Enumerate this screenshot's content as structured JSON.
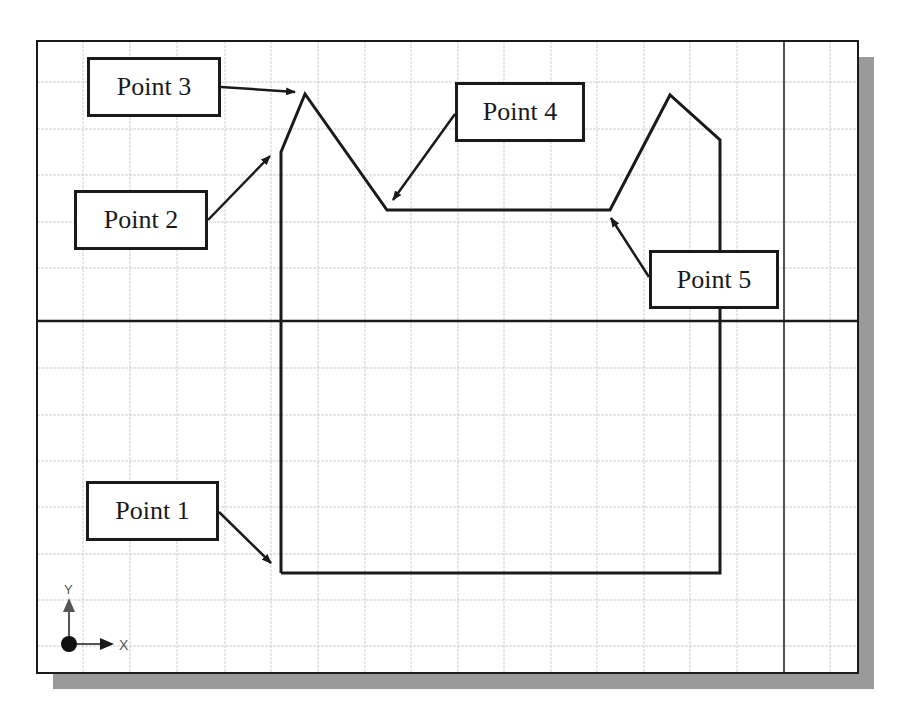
{
  "colors": {
    "background": "#ffffff",
    "grid": "#cfcfcf",
    "frame": "#1a1a1a",
    "shadow": "#9a9a9a",
    "profile": "#1a1a1a",
    "axis_icon": "#555555"
  },
  "canvas": {
    "frame": {
      "x": 37,
      "y": 41,
      "width": 821,
      "height": 632
    },
    "shadow_offset": 16,
    "grid": {
      "vertical": [
        83,
        130,
        177,
        225,
        271,
        318,
        365,
        411,
        458,
        504,
        551,
        597,
        644,
        690,
        737,
        830
      ],
      "horizontal": [
        82,
        129,
        175,
        222,
        268,
        368,
        415,
        461,
        507,
        554,
        600,
        646
      ]
    },
    "axes": {
      "x_axis_y": 321,
      "y_axis_x": 784
    }
  },
  "profile": {
    "points": [
      [
        281,
        573
      ],
      [
        281,
        152
      ],
      [
        305,
        94
      ],
      [
        387,
        210
      ],
      [
        610,
        210
      ],
      [
        670,
        95
      ],
      [
        720,
        140
      ],
      [
        720,
        573
      ],
      [
        281,
        573
      ]
    ]
  },
  "labels": [
    {
      "id": "point-1",
      "text": "Point 1",
      "box": {
        "x": 86,
        "y": 481,
        "w": 133,
        "h": 60
      },
      "arrow": {
        "x1": 219,
        "y1": 512,
        "x2": 271,
        "y2": 563
      }
    },
    {
      "id": "point-2",
      "text": "Point 2",
      "box": {
        "x": 74,
        "y": 190,
        "w": 134,
        "h": 60
      },
      "arrow": {
        "x1": 208,
        "y1": 220,
        "x2": 270,
        "y2": 156
      }
    },
    {
      "id": "point-3",
      "text": "Point 3",
      "box": {
        "x": 87,
        "y": 57,
        "w": 134,
        "h": 60
      },
      "arrow": {
        "x1": 221,
        "y1": 87,
        "x2": 295,
        "y2": 92
      }
    },
    {
      "id": "point-4",
      "text": "Point 4",
      "box": {
        "x": 455,
        "y": 82,
        "w": 130,
        "h": 60
      },
      "arrow": {
        "x1": 455,
        "y1": 114,
        "x2": 393,
        "y2": 200
      }
    },
    {
      "id": "point-5",
      "text": "Point 5",
      "box": {
        "x": 649,
        "y": 250,
        "w": 130,
        "h": 59
      },
      "arrow": {
        "x1": 649,
        "y1": 277,
        "x2": 611,
        "y2": 218
      }
    }
  ],
  "ucs_icon": {
    "origin": {
      "x": 69,
      "y": 644
    },
    "x_label": "X",
    "y_label": "Y"
  }
}
